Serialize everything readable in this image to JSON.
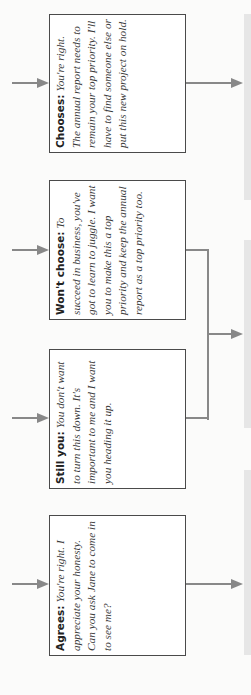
{
  "diagram": {
    "type": "flowchart",
    "orientation": "rotated -90deg",
    "boxes": [
      {
        "label": "Chooses:",
        "text": "You're right. The annual report needs to remain your top priority. I'll have to find someone else or put this new project on hold."
      },
      {
        "label": "Won't choose:",
        "text": "To succeed in business, you've got to learn to juggle. I want you to make this a top priority and keep the annual report as a top priority too."
      },
      {
        "label": "Still you:",
        "text": "You don't want to turn this down. It's important to me and I want you heading it up."
      },
      {
        "label": "Agrees:",
        "text": "You're right. I appreciate your honesty. Can you ask Jane to come in to see me?"
      }
    ],
    "colors": {
      "border": "#4a4a4a",
      "arrow": "#888888",
      "panel": "#e6e6e6"
    }
  }
}
